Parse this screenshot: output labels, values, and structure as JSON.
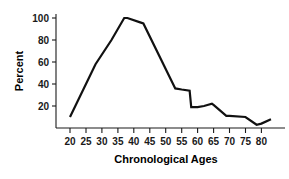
{
  "chart_data": {
    "type": "line",
    "title": "",
    "xlabel": "Chronological Ages",
    "ylabel": "Percent",
    "xlim": [
      17,
      85
    ],
    "ylim": [
      0,
      108
    ],
    "grid": false,
    "legend": null,
    "xticks": [
      20,
      25,
      30,
      35,
      40,
      45,
      50,
      55,
      60,
      65,
      70,
      75,
      80
    ],
    "xtick_labels": [
      "20",
      "25",
      "30",
      "35",
      "40",
      "45",
      "50",
      "55",
      "60",
      "65",
      "70",
      "75",
      "80"
    ],
    "yticks": [
      20,
      40,
      60,
      80,
      100
    ],
    "ytick_labels": [
      "20",
      "40",
      "60",
      "80",
      "100"
    ],
    "series": [
      {
        "name": "Percent",
        "color": "#111111",
        "x": [
          20,
          28,
          33,
          37,
          38,
          42,
          43,
          53,
          55,
          57.5,
          58,
          60,
          62,
          64.5,
          65,
          69,
          70,
          75,
          78.5,
          80,
          83
        ],
        "values": [
          10,
          58,
          80,
          100,
          100,
          96,
          95,
          36,
          35,
          34,
          19,
          19,
          20,
          22,
          21,
          11,
          11,
          10,
          3,
          4,
          8
        ]
      }
    ]
  },
  "axis": {
    "y_label": "Percent",
    "x_label": "Chronological Ages"
  }
}
